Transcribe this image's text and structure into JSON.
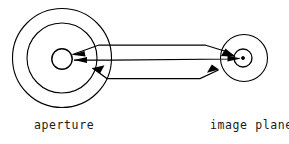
{
  "figure": {
    "kind": "optical-ray-diagram",
    "width": 289,
    "height": 144,
    "background_color": "#ffffff",
    "stroke_color": "#000000"
  },
  "labels": {
    "aperture": "aperture",
    "image_plane": "image plane"
  },
  "diagram_data": {
    "type": "diagram",
    "title": "",
    "description": "Ray bundle from an aperture converging to a point on the image plane",
    "elements": [
      {
        "name": "aperture",
        "label": "aperture",
        "shape": "concentric-circles",
        "center": [
          62,
          58
        ],
        "radii": [
          50,
          35,
          10
        ]
      },
      {
        "name": "image-plane",
        "label": "image plane",
        "shape": "concentric-circles",
        "center": [
          244,
          58
        ],
        "radii": [
          24,
          9,
          1.6
        ]
      }
    ],
    "rays": [
      {
        "name": "upper-ray-bundle",
        "direction": "right-to-left-and-left-to-right",
        "arrowheads": 2
      },
      {
        "name": "axial-ray",
        "direction": "bidirectional",
        "arrowheads": 2
      },
      {
        "name": "lower-ray-bundle",
        "direction": "bidirectional",
        "arrowheads": 2
      }
    ]
  }
}
